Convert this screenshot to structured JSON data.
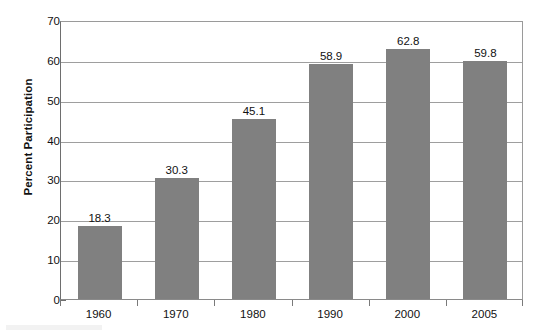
{
  "chart_data": {
    "type": "bar",
    "title": "",
    "xlabel": "",
    "ylabel": "Percent Participation",
    "categories": [
      "1960",
      "1970",
      "1980",
      "1990",
      "2000",
      "2005"
    ],
    "values": [
      18.3,
      30.3,
      45.1,
      58.9,
      62.8,
      59.8
    ],
    "value_labels": [
      "18.3",
      "30.3",
      "45.1",
      "58.9",
      "62.8",
      "59.8"
    ],
    "ylim": [
      0,
      70
    ],
    "ytick_labels": [
      "0",
      "10",
      "20",
      "30",
      "40",
      "50",
      "60",
      "70"
    ],
    "ytick_values": [
      0,
      10,
      20,
      30,
      40,
      50,
      60,
      70
    ],
    "grid": true,
    "grid_axis": "y",
    "legend": false,
    "legend_position": "none",
    "bar_color": "#808080",
    "grid_color": "#9e9e9e",
    "axis_color": "#6e6e6e",
    "background_color": "#ffffff",
    "text_color": "#111111"
  }
}
